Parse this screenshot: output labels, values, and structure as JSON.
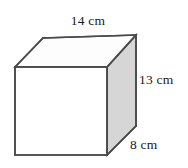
{
  "figure": {
    "type": "rectangular-prism",
    "shape_name": "rectangular prism",
    "background_color": "#ffffff",
    "edge_color": "#4a4a4a",
    "faces": {
      "front": {
        "name": "front-face",
        "fill": "#ffffff"
      },
      "top": {
        "name": "top-face",
        "fill": "#fdfdfd"
      },
      "right": {
        "name": "right-face",
        "fill": "#d6d6d6"
      }
    },
    "labels": {
      "width": "14 cm",
      "height": "13 cm",
      "depth": "8 cm"
    },
    "geometry": {
      "front_top_left": [
        15,
        67
      ],
      "front_top_right": [
        107,
        67
      ],
      "front_bottom_left": [
        15,
        155
      ],
      "front_bottom_right": [
        107,
        155
      ],
      "back_top_left": [
        43,
        38
      ],
      "back_top_right": [
        136,
        35
      ],
      "back_bottom_right": [
        136,
        126
      ]
    }
  }
}
